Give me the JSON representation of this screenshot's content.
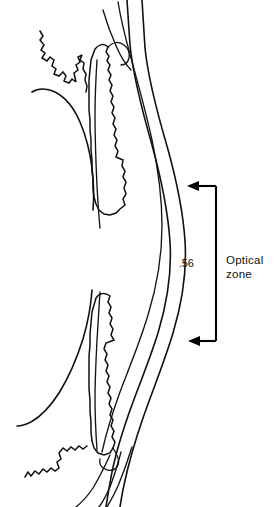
{
  "figure": {
    "type": "anatomical-line-drawing",
    "background_color": "#ffffff",
    "ink_color": "#111111",
    "width": 277,
    "height": 507
  },
  "annotations": {
    "thickness_value": ".56",
    "optical_zone_line1": "Optical",
    "optical_zone_line2": "zone",
    "bracket": {
      "color": "#000000",
      "top_arrow_y": 186,
      "bottom_arrow_y": 341,
      "spine_x": 216,
      "arrow_tip_top_x": 187,
      "arrow_tip_bottom_x": 188
    }
  },
  "icons": {
    "arrow_top": "arrow-left-icon",
    "arrow_bottom": "arrow-left-icon"
  }
}
